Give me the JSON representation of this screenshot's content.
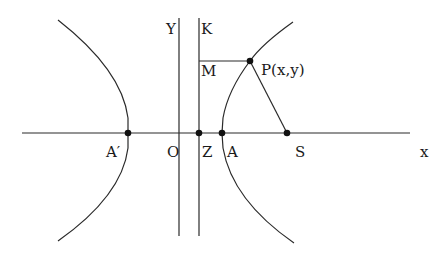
{
  "diagram": {
    "labels": {
      "y_axis": "Y",
      "directrix": "K",
      "foot": "M",
      "point": "P(x,y)",
      "vertex_left": "A′",
      "origin": "O",
      "directrix_foot": "Z",
      "vertex_right": "A",
      "focus": "S",
      "x_axis": "x"
    },
    "points": {
      "A_prime": [
        128,
        133
      ],
      "O": [
        179,
        133
      ],
      "Z": [
        199,
        133
      ],
      "A": [
        222,
        133
      ],
      "S": [
        287,
        133
      ],
      "P": [
        250,
        61
      ],
      "M": [
        199,
        61
      ]
    },
    "colors": {
      "stroke": "#2a2a2a",
      "dot": "#111111",
      "background": "#ffffff"
    }
  }
}
